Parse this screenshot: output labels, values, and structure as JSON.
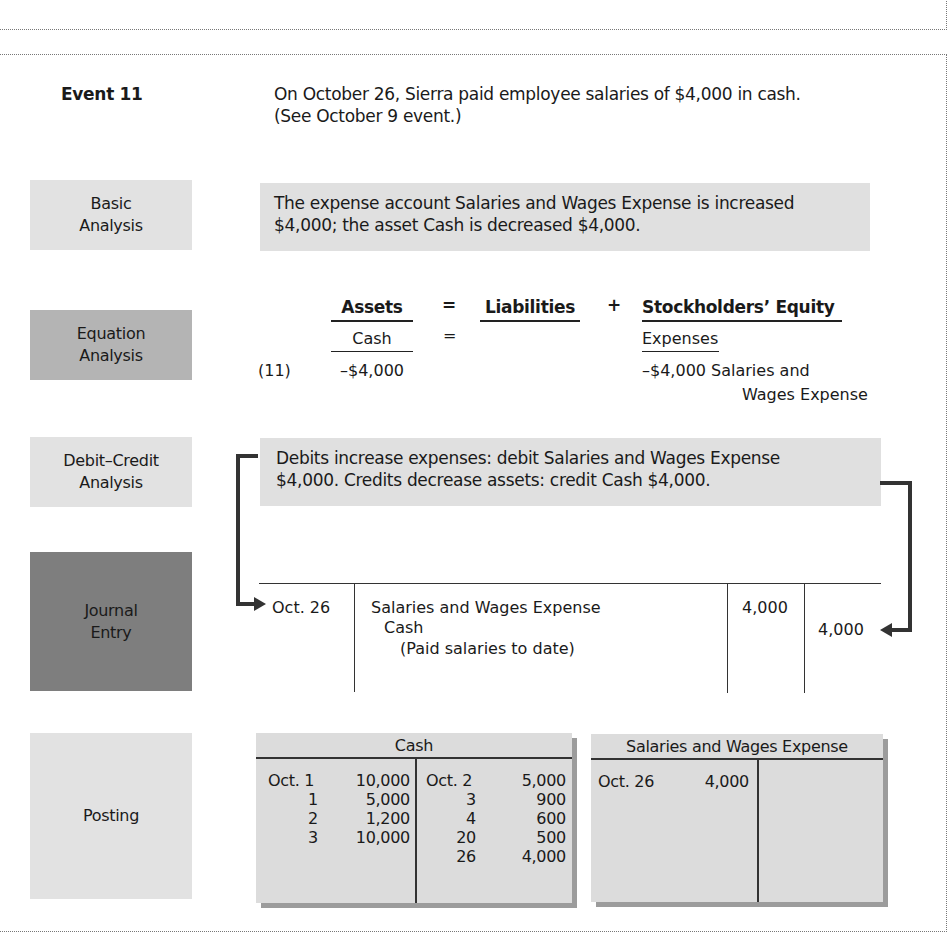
{
  "event": {
    "label": "Event 11",
    "description_line1": "On October 26, Sierra paid employee salaries of $4,000 in cash.",
    "description_line2": "(See October 9 event.)"
  },
  "sections": {
    "basic_analysis": {
      "label_line1": "Basic",
      "label_line2": "Analysis",
      "text_line1": "The expense account Salaries and Wages Expense is increased",
      "text_line2": "$4,000; the asset Cash is decreased $4,000."
    },
    "equation_analysis": {
      "label_line1": "Equation",
      "label_line2": "Analysis",
      "assets_header": "Assets",
      "equals_sign": "=",
      "liabilities_header": "Liabilities",
      "plus_sign": "+",
      "equity_header": "Stockholders’ Equity",
      "assets_sub": "Cash",
      "sub_equals": "=",
      "equity_sub": "Expenses",
      "event_number": "(11)",
      "cash_change": "–$4,000",
      "expense_change": "–$4,000 Salaries and",
      "expense_account_line2": "Wages Expense"
    },
    "debit_credit_analysis": {
      "label_line1": "Debit–Credit",
      "label_line2": "Analysis",
      "text_line1": "Debits increase expenses: debit Salaries and Wages Expense",
      "text_line2": "$4,000. Credits decrease assets: credit Cash $4,000."
    },
    "journal_entry": {
      "label_line1": "Journal",
      "label_line2": "Entry",
      "date": "Oct. 26",
      "debit_account": "Salaries and Wages Expense",
      "credit_account": "Cash",
      "explanation": "(Paid salaries to date)",
      "debit_amount": "4,000",
      "credit_amount": "4,000"
    },
    "posting": {
      "label": "Posting",
      "cash_account": {
        "title": "Cash",
        "debits": [
          {
            "date": "Oct. 1",
            "amount": "10,000"
          },
          {
            "date": "1",
            "amount": "5,000"
          },
          {
            "date": "2",
            "amount": "1,200"
          },
          {
            "date": "3",
            "amount": "10,000"
          }
        ],
        "credits": [
          {
            "date": "Oct. 2",
            "amount": "5,000"
          },
          {
            "date": "3",
            "amount": "900"
          },
          {
            "date": "4",
            "amount": "600"
          },
          {
            "date": "20",
            "amount": "500"
          },
          {
            "date": "26",
            "amount": "4,000"
          }
        ]
      },
      "salaries_account": {
        "title": "Salaries and Wages Expense",
        "debits": [
          {
            "date": "Oct. 26",
            "amount": "4,000"
          }
        ],
        "credits": []
      }
    }
  }
}
